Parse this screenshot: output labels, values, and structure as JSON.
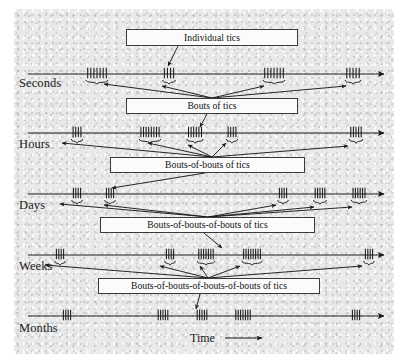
{
  "figure": {
    "background_color": "#e9e9e9",
    "line_color": "#1a1a1a",
    "box_fill": "#fbfbfb",
    "box_border": "#3a3a3a",
    "time_axis_label": "Time",
    "time_arrow_icon": "right-arrow-icon"
  },
  "rows": [
    {
      "id": "seconds",
      "label": "Seconds",
      "axis_y": 74,
      "label_x": 19,
      "label_y": 83,
      "clusters": [
        {
          "x": 97,
          "ticks": 7,
          "spacing": 3.1,
          "brace": true
        },
        {
          "x": 169,
          "ticks": 4,
          "spacing": 3.1,
          "brace": true
        },
        {
          "x": 274,
          "ticks": 7,
          "spacing": 3.1,
          "brace": true
        },
        {
          "x": 353,
          "ticks": 5,
          "spacing": 3.1,
          "brace": true
        }
      ]
    },
    {
      "id": "hours",
      "label": "Hours",
      "axis_y": 133,
      "label_x": 19,
      "label_y": 144,
      "clusters": [
        {
          "x": 77,
          "ticks": 4,
          "spacing": 2.6,
          "brace": true
        },
        {
          "x": 150,
          "ticks": 8,
          "spacing": 2.6,
          "brace": true
        },
        {
          "x": 195,
          "ticks": 6,
          "spacing": 2.6,
          "brace": true
        },
        {
          "x": 232,
          "ticks": 4,
          "spacing": 2.6,
          "brace": true
        },
        {
          "x": 356,
          "ticks": 5,
          "spacing": 2.6,
          "brace": true
        }
      ]
    },
    {
      "id": "days",
      "label": "Days",
      "axis_y": 194,
      "label_x": 19,
      "label_y": 205,
      "clusters": [
        {
          "x": 77,
          "ticks": 4,
          "spacing": 2.4,
          "brace": true
        },
        {
          "x": 110,
          "ticks": 4,
          "spacing": 2.4,
          "brace": true
        },
        {
          "x": 283,
          "ticks": 4,
          "spacing": 2.4,
          "brace": true
        },
        {
          "x": 320,
          "ticks": 5,
          "spacing": 2.4,
          "brace": true
        },
        {
          "x": 359,
          "ticks": 6,
          "spacing": 2.4,
          "brace": true
        }
      ]
    },
    {
      "id": "weeks",
      "label": "Weeks",
      "axis_y": 255,
      "label_x": 19,
      "label_y": 267,
      "clusters": [
        {
          "x": 60,
          "ticks": 4,
          "spacing": 2.4,
          "brace": true
        },
        {
          "x": 170,
          "ticks": 4,
          "spacing": 2.4,
          "brace": true
        },
        {
          "x": 206,
          "ticks": 7,
          "spacing": 2.4,
          "brace": true
        },
        {
          "x": 252,
          "ticks": 8,
          "spacing": 2.4,
          "brace": true
        },
        {
          "x": 369,
          "ticks": 4,
          "spacing": 2.4,
          "brace": true
        }
      ]
    },
    {
      "id": "months",
      "label": "Months",
      "axis_y": 316,
      "label_x": 19,
      "label_y": 329,
      "clusters": [
        {
          "x": 67,
          "ticks": 4,
          "spacing": 2.4,
          "brace": false
        },
        {
          "x": 163,
          "ticks": 5,
          "spacing": 2.4,
          "brace": false
        },
        {
          "x": 202,
          "ticks": 5,
          "spacing": 2.4,
          "brace": false
        },
        {
          "x": 243,
          "ticks": 7,
          "spacing": 2.4,
          "brace": false
        },
        {
          "x": 356,
          "ticks": 4,
          "spacing": 2.4,
          "brace": false
        }
      ]
    }
  ],
  "callouts": [
    {
      "id": "individual-tics",
      "text": "Individual tics",
      "x": 126,
      "y": 29,
      "width": 172,
      "height": 17
    },
    {
      "id": "bouts-of-tics",
      "text": "Bouts of tics",
      "x": 126,
      "y": 98,
      "width": 172,
      "height": 16
    },
    {
      "id": "bouts-of-bouts-of-tics",
      "text": "Bouts-of-bouts of tics",
      "x": 110,
      "y": 157,
      "width": 195,
      "height": 16
    },
    {
      "id": "bouts-of-bouts-of-bouts-of-tics",
      "text": "Bouts-of-bouts-of-bouts of tics",
      "x": 100,
      "y": 217,
      "width": 215,
      "height": 16
    },
    {
      "id": "bouts-of-bouts-of-bouts-of-bouts-of-tics",
      "text": "Bouts-of-bouts-of-bouts-of-bouts of tics",
      "x": 98,
      "y": 278,
      "width": 222,
      "height": 16
    }
  ],
  "time_label": {
    "text": "Time",
    "x": 196,
    "y": 341
  }
}
